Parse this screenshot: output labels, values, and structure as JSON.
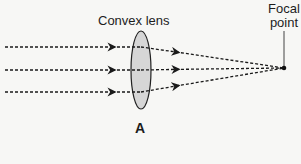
{
  "diagram": {
    "lens": {
      "label": "Convex lens",
      "fill": "#d6d6d6",
      "stroke": "#222222"
    },
    "focal_point": {
      "label_line1": "Focal",
      "label_line2": "point"
    },
    "figure_label": "A",
    "rays": [
      {
        "name": "top-ray",
        "y_in": 47
      },
      {
        "name": "middle-ray",
        "y_in": 70
      },
      {
        "name": "bottom-ray",
        "y_in": 92
      }
    ],
    "ray_style": "dashed",
    "ray_color": "#1a1a1a",
    "background": "#f7f7f5"
  }
}
